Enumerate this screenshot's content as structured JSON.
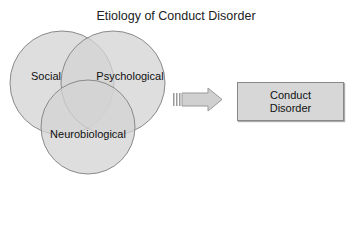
{
  "title": "Etiology of Conduct Disorder",
  "circles": [
    {
      "label": "Social"
    },
    {
      "label": "Psychological"
    },
    {
      "label": "Neurobiological"
    }
  ],
  "outcome": {
    "line1": "Conduct",
    "line2": "Disorder"
  },
  "colors": {
    "circle_fill": "#d4d4d4",
    "circle_stroke": "#8a8a8a",
    "box_fill": "#d7d7d7",
    "arrow_fill": "#d0d0d0"
  }
}
